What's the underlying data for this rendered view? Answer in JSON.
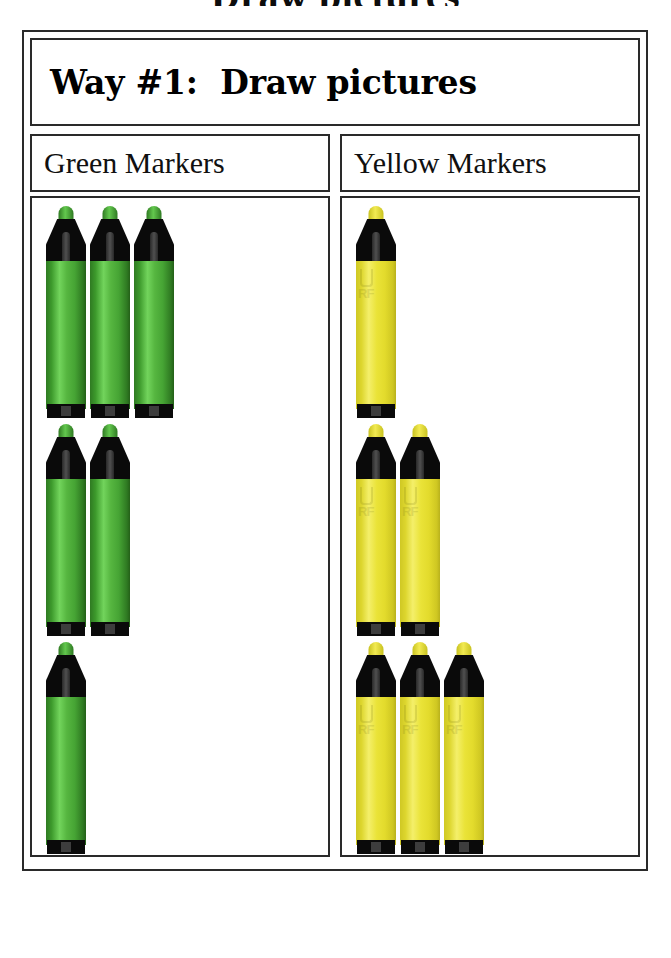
{
  "page": {
    "clipped_title_above": "Draw pictures",
    "background": "#ffffff"
  },
  "worksheet": {
    "title": "Way #1:  Draw pictures",
    "columns": [
      {
        "header": "Green Markers",
        "color_name": "green",
        "color_hex": "#4aa83a",
        "nib_hex": "#63c84e",
        "cap_hex": "#0a0a0a",
        "total": 6,
        "rows": [
          3,
          2,
          1
        ],
        "logo_text": "RF"
      },
      {
        "header": "Yellow Markers",
        "color_name": "yellow",
        "color_hex": "#e8e234",
        "nib_hex": "#f2ea52",
        "cap_hex": "#0a0a0a",
        "total": 6,
        "rows": [
          1,
          2,
          3
        ],
        "logo_text": "RF"
      }
    ]
  },
  "chart_data": {
    "type": "bar",
    "title": "Way #1:  Draw pictures",
    "categories": [
      "Green Markers",
      "Yellow Markers"
    ],
    "values": [
      6,
      6
    ],
    "xlabel": "",
    "ylabel": "Number of markers",
    "ylim": [
      0,
      6
    ],
    "grid": false,
    "legend": "none",
    "annotations": [
      "Green Markers drawn in rows of 3, 2, 1",
      "Yellow Markers drawn in rows of 1, 2, 3"
    ]
  }
}
